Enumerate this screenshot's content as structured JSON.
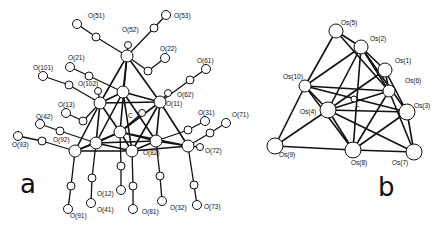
{
  "panel_a": {
    "label": "a",
    "carbide": "C",
    "oxygen_labels": [
      {
        "id": "O51",
        "text": "O(51)",
        "x": 88,
        "y": 18
      },
      {
        "id": "O53",
        "text": "O(53)",
        "x": 174,
        "y": 18
      },
      {
        "id": "O52",
        "text": "O(52)",
        "x": 122,
        "y": 32
      },
      {
        "id": "O22",
        "text": "O(22)",
        "x": 160,
        "y": 51
      },
      {
        "id": "O21",
        "text": "O(21)",
        "x": 68,
        "y": 60
      },
      {
        "id": "O101",
        "text": "O(101)",
        "x": 33,
        "y": 70
      },
      {
        "id": "O61",
        "text": "O(61)",
        "x": 197,
        "y": 63
      },
      {
        "id": "O102",
        "text": "O(102)",
        "x": 78,
        "y": 86
      },
      {
        "id": "O62",
        "text": "O(62)",
        "x": 177,
        "y": 97
      },
      {
        "id": "O11",
        "text": "O(11)",
        "x": 166,
        "y": 106
      },
      {
        "id": "O13",
        "text": "O(13)",
        "x": 58,
        "y": 107
      },
      {
        "id": "O31",
        "text": "O(31)",
        "x": 198,
        "y": 115
      },
      {
        "id": "O71",
        "text": "O(71)",
        "x": 232,
        "y": 117
      },
      {
        "id": "O42",
        "text": "O(42)",
        "x": 36,
        "y": 119
      },
      {
        "id": "O93",
        "text": "O(93)",
        "x": 12,
        "y": 147
      },
      {
        "id": "O92",
        "text": "O(92)",
        "x": 53,
        "y": 142
      },
      {
        "id": "O82",
        "text": "O(82)",
        "x": 143,
        "y": 155
      },
      {
        "id": "O72",
        "text": "O(72)",
        "x": 205,
        "y": 153
      },
      {
        "id": "O12",
        "text": "O(12)",
        "x": 97,
        "y": 196
      },
      {
        "id": "O41",
        "text": "O(41)",
        "x": 97,
        "y": 212
      },
      {
        "id": "O81",
        "text": "O(81)",
        "x": 142,
        "y": 214
      },
      {
        "id": "O32",
        "text": "O(32)",
        "x": 170,
        "y": 210
      },
      {
        "id": "O73",
        "text": "O(73)",
        "x": 204,
        "y": 209
      },
      {
        "id": "O91",
        "text": "O(91)",
        "x": 70,
        "y": 218
      }
    ]
  },
  "panel_b": {
    "label": "b",
    "carbide": "C",
    "osmium_labels": [
      {
        "id": "Os5",
        "text": "Os(5)",
        "x": 341,
        "y": 25
      },
      {
        "id": "Os2",
        "text": "Os(2)",
        "x": 370,
        "y": 41
      },
      {
        "id": "Os1",
        "text": "Os(1)",
        "x": 395,
        "y": 63
      },
      {
        "id": "Os6",
        "text": "Os(6)",
        "x": 405,
        "y": 83
      },
      {
        "id": "Os10",
        "text": "Os(10)",
        "x": 283,
        "y": 79
      },
      {
        "id": "Os4",
        "text": "Os(4)",
        "x": 300,
        "y": 114
      },
      {
        "id": "Os3",
        "text": "Os(3)",
        "x": 414,
        "y": 108
      },
      {
        "id": "Os9",
        "text": "Os(9)",
        "x": 279,
        "y": 157
      },
      {
        "id": "Os8",
        "text": "Os(8)",
        "x": 351,
        "y": 165
      },
      {
        "id": "Os7",
        "text": "Os(7)",
        "x": 392,
        "y": 165
      }
    ]
  }
}
